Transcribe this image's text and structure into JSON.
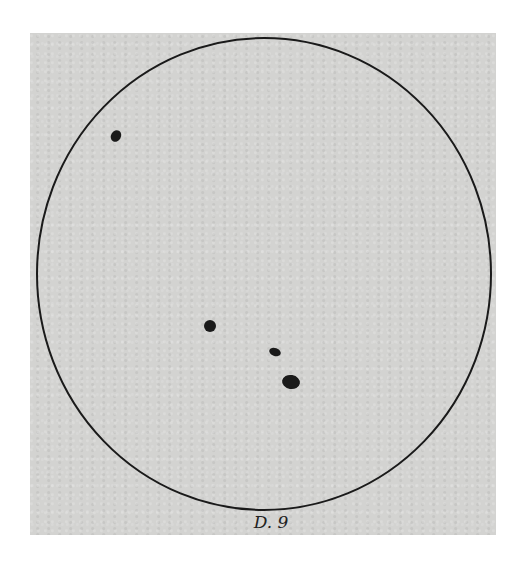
{
  "drawing": {
    "subject": "solar disk sunspot drawing",
    "paper_color": "#d3d3d1",
    "ink_color": "#1a1a1a",
    "disk": {
      "cx": 264,
      "cy": 274,
      "rx": 227,
      "ry": 236
    },
    "sunspots": [
      {
        "id": "spot-1",
        "cx": 116,
        "cy": 136,
        "rx": 5,
        "ry": 6,
        "rotate": 30
      },
      {
        "id": "spot-2",
        "cx": 210,
        "cy": 326,
        "rx": 6,
        "ry": 6,
        "rotate": 0
      },
      {
        "id": "spot-3",
        "cx": 275,
        "cy": 352,
        "rx": 6,
        "ry": 4,
        "rotate": 20
      },
      {
        "id": "spot-4",
        "cx": 291,
        "cy": 382,
        "rx": 9,
        "ry": 7,
        "rotate": 10
      }
    ],
    "caption": "D. 9"
  }
}
